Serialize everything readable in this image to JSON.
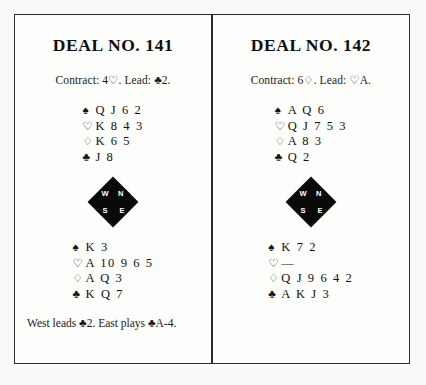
{
  "page": {
    "background_color": "#fbfaf8",
    "frame_border_color": "#2c2c2c"
  },
  "suits": {
    "spade": "♠",
    "heart": "♡",
    "diamond": "♢",
    "club": "♣"
  },
  "compass": {
    "north": "N",
    "south": "S",
    "west": "W",
    "east": "E"
  },
  "deals": [
    {
      "title": "DEAL NO. 141",
      "contract_line": "Contract: 4♡. Lead: ♣2.",
      "north": {
        "spades": "Q J 6 2",
        "hearts": "K 8 4 3",
        "diamonds": "K 6 5",
        "clubs": "J 8"
      },
      "south": {
        "spades": "K 3",
        "hearts": "A 10 9 6 5",
        "diamonds": "A Q 3",
        "clubs": "K Q 7"
      },
      "footer": "West leads ♣2. East plays ♣A-4."
    },
    {
      "title": "DEAL NO. 142",
      "contract_line": "Contract: 6♢. Lead: ♡A.",
      "north": {
        "spades": "A Q 6",
        "hearts": "Q J 7 5 3",
        "diamonds": "A 8 3",
        "clubs": "Q 2"
      },
      "south": {
        "spades": "K 7 2",
        "hearts": "—",
        "diamonds": "Q J 9 6 4 2",
        "clubs": "A K J 3"
      },
      "footer": ""
    }
  ]
}
